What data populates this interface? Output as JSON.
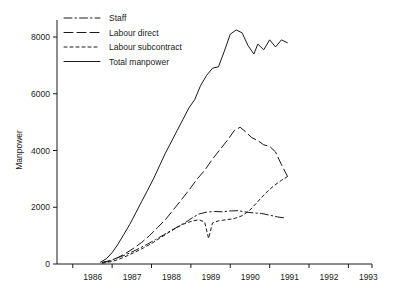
{
  "chart_data": {
    "type": "line",
    "title": "",
    "xlabel": "",
    "ylabel": "Manpower",
    "xlim": [
      1985.6,
      1993.6
    ],
    "ylim": [
      0,
      8600
    ],
    "yticks": [
      0,
      2000,
      4000,
      6000,
      8000
    ],
    "ytick_labels": [
      "0",
      "2000",
      "4000",
      "6000",
      "8000"
    ],
    "xticks": [
      1986,
      1987,
      1988,
      1989,
      1990,
      1991,
      1992,
      1993
    ],
    "xtick_labels": [
      "1986",
      "1987",
      "1988",
      "1989",
      "1990",
      "1991",
      "1992",
      "1993"
    ],
    "grid": false,
    "legend_position": "top-left",
    "series": [
      {
        "name": "Staff",
        "style": "dash-dot",
        "x": [
          1986.75,
          1986.95,
          1987.1,
          1987.3,
          1987.5,
          1987.7,
          1987.9,
          1988.1,
          1988.3,
          1988.5,
          1988.7,
          1988.9,
          1989.05,
          1989.2,
          1989.4,
          1989.6,
          1989.8,
          1990.0,
          1990.2,
          1990.4,
          1990.6,
          1990.8,
          1991.0,
          1991.2,
          1991.4
        ],
        "y": [
          60,
          120,
          200,
          300,
          420,
          560,
          700,
          860,
          1020,
          1180,
          1340,
          1500,
          1640,
          1760,
          1830,
          1850,
          1840,
          1870,
          1880,
          1830,
          1800,
          1780,
          1720,
          1660,
          1620
        ]
      },
      {
        "name": "Labour direct",
        "style": "long-dash",
        "x": [
          1986.75,
          1986.95,
          1987.15,
          1987.35,
          1987.55,
          1987.75,
          1987.95,
          1988.15,
          1988.35,
          1988.55,
          1988.75,
          1988.95,
          1989.15,
          1989.35,
          1989.55,
          1989.75,
          1989.95,
          1990.1,
          1990.25,
          1990.4,
          1990.55,
          1990.7,
          1990.85,
          1991.0,
          1991.15,
          1991.3,
          1991.45
        ],
        "y": [
          40,
          110,
          230,
          380,
          560,
          760,
          1000,
          1280,
          1560,
          1900,
          2250,
          2600,
          2980,
          3300,
          3700,
          4050,
          4400,
          4700,
          4820,
          4650,
          4450,
          4350,
          4200,
          4150,
          3950,
          3500,
          3100
        ]
      },
      {
        "name": "Labour subcontract",
        "style": "short-dash",
        "x": [
          1986.75,
          1987.0,
          1987.2,
          1987.4,
          1987.6,
          1987.8,
          1988.0,
          1988.2,
          1988.4,
          1988.6,
          1988.8,
          1989.0,
          1989.2,
          1989.35,
          1989.45,
          1989.55,
          1989.7,
          1989.9,
          1990.1,
          1990.3,
          1990.5,
          1990.7,
          1990.9,
          1991.1,
          1991.3,
          1991.45
        ],
        "y": [
          30,
          90,
          180,
          300,
          430,
          570,
          720,
          900,
          1080,
          1250,
          1400,
          1500,
          1560,
          1480,
          900,
          1450,
          1520,
          1560,
          1600,
          1700,
          1900,
          2200,
          2500,
          2750,
          2950,
          3080
        ]
      },
      {
        "name": "Total manpower",
        "style": "solid",
        "x": [
          1986.7,
          1986.85,
          1987.0,
          1987.15,
          1987.3,
          1987.45,
          1987.6,
          1987.75,
          1987.9,
          1988.05,
          1988.2,
          1988.35,
          1988.5,
          1988.65,
          1988.8,
          1988.95,
          1989.1,
          1989.25,
          1989.4,
          1989.55,
          1989.7,
          1989.85,
          1990.0,
          1990.15,
          1990.3,
          1990.45,
          1990.6,
          1990.7,
          1990.85,
          1991.0,
          1991.15,
          1991.3,
          1991.45
        ],
        "y": [
          60,
          180,
          400,
          700,
          1050,
          1400,
          1800,
          2200,
          2600,
          3000,
          3450,
          3900,
          4300,
          4700,
          5100,
          5500,
          5800,
          6300,
          6650,
          6900,
          6950,
          7500,
          8100,
          8250,
          8150,
          7700,
          7400,
          7750,
          7550,
          7900,
          7650,
          7900,
          7800
        ]
      }
    ]
  },
  "legend": {
    "items": [
      {
        "label": "Staff"
      },
      {
        "label": "Labour direct"
      },
      {
        "label": "Labour subcontract"
      },
      {
        "label": "Total manpower"
      }
    ]
  }
}
